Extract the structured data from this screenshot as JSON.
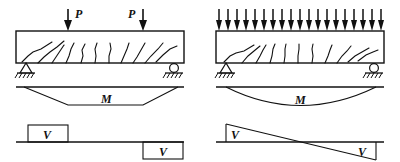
{
  "figure": {
    "type": "structural-engineering-diagram",
    "panels": [
      {
        "id": "two-point-loads",
        "loading": {
          "kind": "point-loads",
          "count": 2,
          "labels": [
            "P",
            "P"
          ],
          "label_positions": [
            "right-of-arrow",
            "left-of-arrow"
          ],
          "arrow_x": [
            68,
            143
          ],
          "arrow_top": 8,
          "arrow_bottom": 30
        },
        "beam": {
          "x": 16,
          "y": 31,
          "width": 168,
          "height": 32,
          "crack_count": 11
        },
        "supports": [
          {
            "kind": "pin",
            "name": "pin-support",
            "x": 26,
            "y": 63
          },
          {
            "kind": "roller",
            "name": "roller-support",
            "x": 174,
            "y": 63
          }
        ],
        "moment_diagram": {
          "label": "M",
          "shape": "trapezoidal",
          "baseline_y": 87,
          "peak_y": 105,
          "break_x": [
            68,
            143
          ],
          "label_x": 106,
          "label_y": 103
        },
        "shear_diagram": {
          "label_left": "V",
          "label_right": "V",
          "shape": "stepped-rectangles",
          "baseline_y": 142,
          "left_block": {
            "x": 28,
            "width": 40,
            "height": 17,
            "side": "above"
          },
          "right_block": {
            "x": 143,
            "width": 40,
            "height": 17,
            "side": "below"
          }
        }
      },
      {
        "id": "uniform-distributed-load",
        "loading": {
          "kind": "distributed-load",
          "count": 19,
          "labels": [],
          "arrow_top": 8,
          "arrow_bottom": 30,
          "span_x": [
            219,
            381
          ]
        },
        "beam": {
          "x": 216,
          "y": 31,
          "width": 168,
          "height": 32,
          "crack_count": 11
        },
        "supports": [
          {
            "kind": "pin",
            "name": "pin-support",
            "x": 226,
            "y": 63
          },
          {
            "kind": "roller",
            "name": "roller-support",
            "x": 374,
            "y": 63
          }
        ],
        "moment_diagram": {
          "label": "M",
          "shape": "parabolic",
          "baseline_y": 87,
          "peak_y": 108,
          "label_x": 300,
          "label_y": 103
        },
        "shear_diagram": {
          "label_left": "V",
          "label_right": "V",
          "shape": "linear-triangles",
          "baseline_y": 142,
          "left_peak_y": 124,
          "right_peak_y": 160,
          "zero_x": 300
        }
      }
    ],
    "colors": {
      "ink": "#111111",
      "line": "#222222",
      "background": "#ffffff"
    }
  }
}
